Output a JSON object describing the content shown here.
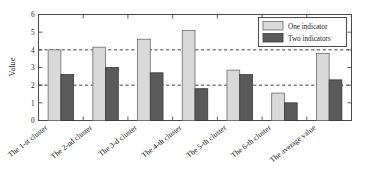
{
  "chart_data": {
    "type": "bar",
    "title": "",
    "xlabel": "",
    "ylabel": "Value",
    "ylim": [
      0,
      6
    ],
    "yticks": [
      0,
      1,
      2,
      3,
      4,
      5,
      6
    ],
    "gridlines": [
      2,
      4
    ],
    "grid": true,
    "legend_position": "top-right",
    "categories": [
      "The 1-st cluster",
      "The 2-nd cluster",
      "The 3-d cluster",
      "The 4-th cluster",
      "The 5-th cluster",
      "The 6-th cluster",
      "The average value"
    ],
    "series": [
      {
        "name": "One indicator",
        "color": "#d9d9d9",
        "values": [
          4.0,
          4.15,
          4.6,
          5.1,
          2.85,
          1.55,
          3.8
        ]
      },
      {
        "name": "Two indicators",
        "color": "#5a5a5a",
        "values": [
          2.6,
          3.0,
          2.7,
          1.8,
          2.6,
          1.0,
          2.3
        ]
      }
    ]
  },
  "legend": {
    "entries": [
      {
        "label": "One indicator"
      },
      {
        "label": "Two indicators"
      }
    ]
  },
  "axes": {
    "y_label": "Value",
    "y_ticks": [
      "0",
      "1",
      "2",
      "3",
      "4",
      "5",
      "6"
    ]
  }
}
